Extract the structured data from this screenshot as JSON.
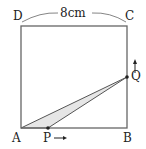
{
  "diagram": {
    "labels": {
      "A": "A",
      "B": "B",
      "C": "C",
      "D": "D",
      "P": "P",
      "Q": "Q"
    },
    "side_length": "8cm",
    "shape": "square ABCD with moving points P on AB and Q on BC; triangle APQ shaded",
    "colors": {
      "line": "#666666",
      "shade": "#e6e6e6",
      "text": "#222222"
    }
  }
}
